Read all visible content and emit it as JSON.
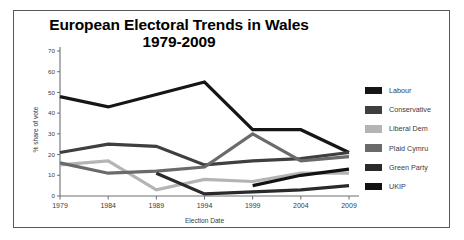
{
  "chart_data": {
    "type": "line",
    "title": "European Electoral Trends in Wales 1979-2009",
    "title_line1": "European Electoral Trends in Wales",
    "title_line2": "1979-2009",
    "xlabel": "Election Date",
    "ylabel": "% share of vote",
    "categories": [
      "1979",
      "1984",
      "1989",
      "1994",
      "1999",
      "2004",
      "2009"
    ],
    "x": [
      1979,
      1984,
      1989,
      1994,
      1999,
      2004,
      2009
    ],
    "ylim": [
      0,
      70
    ],
    "yticks": [
      0,
      10,
      20,
      30,
      40,
      50,
      60,
      70
    ],
    "ytick_labels": [
      "0",
      "10",
      "20",
      "30",
      "40",
      "50",
      "60",
      "70"
    ],
    "xtick_labels": [
      "1979",
      "1984",
      "1989",
      "1994",
      "1999",
      "2004",
      "2009"
    ],
    "grid": false,
    "legend_position": "right",
    "series": [
      {
        "name": "Labour",
        "color": "#161616",
        "x": [
          1979,
          1984,
          1989,
          1994,
          1999,
          2004,
          2009
        ],
        "values": [
          48,
          43,
          49,
          55,
          32,
          32,
          21
        ]
      },
      {
        "name": "Conservative",
        "color": "#3f3f41",
        "x": [
          1979,
          1984,
          1989,
          1994,
          1999,
          2004,
          2009
        ],
        "values": [
          21,
          25,
          24,
          15,
          17,
          18,
          21
        ]
      },
      {
        "name": "Liberal Dem",
        "color": "#b4b4b6",
        "x": [
          1979,
          1984,
          1989,
          1994,
          1999,
          2004,
          2009
        ],
        "values": [
          15,
          17,
          3,
          8,
          7,
          11,
          11
        ]
      },
      {
        "name": "Plaid Cymru",
        "color": "#6a6a6c",
        "x": [
          1979,
          1984,
          1989,
          1994,
          1999,
          2004,
          2009
        ],
        "values": [
          16,
          11,
          12,
          14,
          30,
          17,
          19
        ]
      },
      {
        "name": "Green Party",
        "color": "#2a2a2c",
        "x": [
          1989,
          1994,
          1999,
          2004,
          2009
        ],
        "values": [
          11,
          1,
          2,
          3,
          5
        ]
      },
      {
        "name": "UKIP",
        "color": "#121212",
        "x": [
          1999,
          2004,
          2009
        ],
        "values": [
          5,
          10,
          13
        ]
      }
    ]
  },
  "legend": {
    "items": [
      {
        "label": "Labour",
        "color": "#161616"
      },
      {
        "label": "Conservative",
        "color": "#3f3f41"
      },
      {
        "label": "Liberal Dem",
        "color": "#b4b4b6"
      },
      {
        "label": "Plaid Cymru",
        "color": "#6a6a6c"
      },
      {
        "label": "Green Party",
        "color": "#2a2a2c"
      },
      {
        "label": "UKIP",
        "color": "#121212"
      }
    ]
  }
}
